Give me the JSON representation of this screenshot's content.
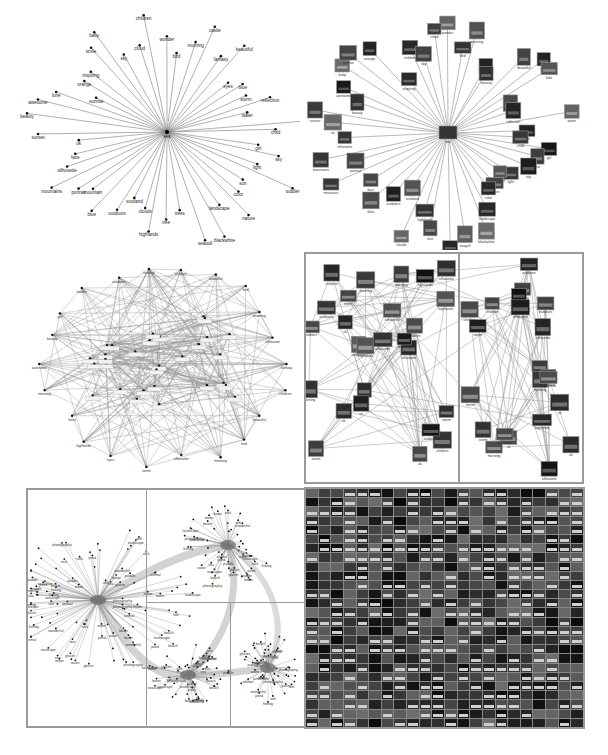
{
  "figure": {
    "panels": [
      {
        "id": "a",
        "description": "Star graph, tag labels only",
        "center_label": "sea",
        "tags": [
          "wonder",
          "bird",
          "morning",
          "castle",
          "fantasy",
          "beautiful",
          "eyes",
          "blue",
          "storm",
          "reflection",
          "water",
          "red",
          "child",
          "girl",
          "sky",
          "light",
          "toddler",
          "sun",
          "color",
          "nature",
          "landscape",
          "blackwhite",
          "seagull",
          "trees",
          "tree",
          "highlands",
          "clouds",
          "scotland",
          "outdoors",
          "blue",
          "mountain",
          "portrait",
          "mountains",
          "silhouette",
          "face",
          "uk",
          "sunset",
          "beauty",
          "awesome",
          "lone",
          "sunrise",
          "orange",
          "inspiring",
          "smile",
          "baby",
          "sky",
          "cloud",
          "children"
        ]
      },
      {
        "id": "b",
        "description": "Star graph with image thumbnails",
        "center_label": "sea",
        "tags": [
          "wonder",
          "bird",
          "morning",
          "castle",
          "fantasy",
          "beautiful",
          "eyes",
          "kids",
          "storm",
          "reflection",
          "water",
          "red",
          "child",
          "girl",
          "sun",
          "sky",
          "light",
          "toddler",
          "nature",
          "color",
          "landscape",
          "blackwhite",
          "seagull",
          "trees",
          "tree",
          "highlands",
          "clouds",
          "scotland",
          "outdoors",
          "blue",
          "face",
          "mountain",
          "portrait",
          "mountains",
          "silhouette",
          "uk",
          "sunset",
          "beauty",
          "awesome",
          "baby",
          "sunrise",
          "orange",
          "inspiring",
          "children",
          "sky",
          "cloud"
        ]
      },
      {
        "id": "c",
        "description": "Dense clique graph, tag labels",
        "visible_labels": [
          "fantasy",
          "children",
          "beautiful",
          "bird",
          "morning",
          "silhouette",
          "storm",
          "eyes",
          "highlands",
          "trees",
          "morning",
          "awesome",
          "beauty",
          "girl",
          "toddler",
          "outdoors"
        ]
      },
      {
        "id": "d",
        "description": "Two clustered subgraphs with image thumbnails",
        "visible_labels": [
          "outdoors",
          "storm",
          "morning",
          "silhouette",
          "uk",
          "highlands",
          "children"
        ]
      },
      {
        "id": "e",
        "description": "Large tag network with multiple hubs",
        "visible_labels": [
          "fishing",
          "puddle",
          "moon",
          "boats",
          "seascape",
          "pond",
          "glacier",
          "rock",
          "photography",
          "animal",
          "soft",
          "wonderful",
          "sea",
          "landscape",
          "water",
          "beach"
        ]
      },
      {
        "id": "f",
        "description": "Dense photo mosaic with tag captions",
        "visible_labels": [
          "sea",
          "blue",
          "bright",
          "flowers",
          "light",
          "color",
          "nature"
        ]
      }
    ]
  }
}
